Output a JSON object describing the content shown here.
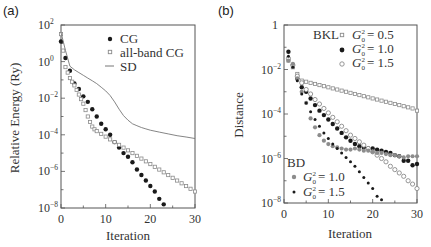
{
  "chart_data": [
    {
      "panel": "(a)",
      "type": "scatter",
      "xlabel": "Iteration",
      "ylabel": "Relative Energy (Ry)",
      "yscale": "log",
      "xlim": [
        0,
        30
      ],
      "ylim": [
        1e-08,
        100
      ],
      "xticks": [
        0,
        10,
        20,
        30
      ],
      "xtick_labels": [
        "0",
        "10",
        "20",
        "30"
      ],
      "yticks_log10": [
        2,
        0,
        -2,
        -4,
        -6,
        -8
      ],
      "ytick_labels": [
        [
          "10",
          "2"
        ],
        [
          "10",
          "0"
        ],
        [
          "10",
          "−2"
        ],
        [
          "10",
          "−4"
        ],
        [
          "10",
          "−6"
        ],
        [
          "10",
          "−8"
        ]
      ],
      "grid": false,
      "legend_position": "upper right",
      "series": [
        {
          "name": "CG",
          "marker": "filled-circle",
          "x": [
            0,
            1,
            2,
            3,
            4,
            5,
            6,
            7,
            8,
            9,
            10,
            11,
            12,
            13,
            14,
            15,
            16,
            17,
            18,
            19,
            20,
            21,
            22,
            23
          ],
          "log10_y": [
            1.1,
            0.2,
            -0.5,
            -1.2,
            -1.5,
            -1.9,
            -2.2,
            -2.6,
            -3.0,
            -3.4,
            -3.7,
            -4.0,
            -4.4,
            -4.7,
            -5.0,
            -5.2,
            -5.5,
            -5.9,
            -6.2,
            -6.5,
            -6.8,
            -7.1,
            -7.5,
            -7.8
          ]
        },
        {
          "name": "all-band CG",
          "marker": "open-square",
          "x": [
            0,
            0.5,
            1,
            1.5,
            2,
            2.5,
            3,
            3.5,
            4,
            4.5,
            5,
            5.5,
            6,
            6.5,
            7,
            7.5,
            8,
            9,
            10,
            11,
            12,
            13,
            14,
            15,
            16,
            17,
            18,
            19,
            20,
            21,
            22,
            23,
            24,
            25,
            26,
            27,
            28,
            29,
            30
          ],
          "log10_y": [
            1.5,
            0.6,
            -0.3,
            -0.6,
            -0.9,
            -1.1,
            -1.3,
            -1.55,
            -1.8,
            -2.05,
            -2.3,
            -2.65,
            -3.0,
            -3.3,
            -3.55,
            -3.7,
            -3.8,
            -3.95,
            -4.1,
            -4.25,
            -4.4,
            -4.55,
            -4.7,
            -4.85,
            -5.0,
            -5.15,
            -5.3,
            -5.45,
            -5.6,
            -5.75,
            -5.9,
            -6.05,
            -6.2,
            -6.35,
            -6.5,
            -6.65,
            -6.8,
            -6.95,
            -7.1
          ]
        },
        {
          "name": "SD",
          "marker": "line",
          "x": [
            0,
            1,
            2,
            3,
            4,
            5,
            6,
            7,
            8,
            9,
            10,
            11,
            12,
            13,
            14,
            15,
            16,
            17,
            18,
            19,
            20,
            22,
            24,
            26,
            28,
            30
          ],
          "log10_y": [
            1.6,
            0.6,
            -0.25,
            -0.45,
            -0.6,
            -0.75,
            -0.9,
            -1.05,
            -1.2,
            -1.4,
            -1.6,
            -1.85,
            -2.2,
            -2.6,
            -2.95,
            -3.2,
            -3.4,
            -3.5,
            -3.6,
            -3.68,
            -3.75,
            -3.85,
            -3.95,
            -4.05,
            -4.12,
            -4.2
          ]
        }
      ]
    },
    {
      "panel": "(b)",
      "type": "scatter",
      "xlabel": "Iteration",
      "ylabel": "Distance",
      "yscale": "log",
      "xlim": [
        0,
        30
      ],
      "ylim": [
        1e-08,
        1
      ],
      "xticks": [
        0,
        10,
        20,
        30
      ],
      "xtick_labels": [
        "0",
        "10",
        "20",
        "30"
      ],
      "yticks_log10": [
        0,
        -2,
        -4,
        -6,
        -8
      ],
      "ytick_labels": [
        [
          "1",
          ""
        ],
        [
          "10",
          "−2"
        ],
        [
          "10",
          "−4"
        ],
        [
          "10",
          "−6"
        ],
        [
          "10",
          "−8"
        ]
      ],
      "grid": false,
      "legend_groups": [
        {
          "title": "BKL",
          "position": "upper right",
          "entries": [
            "G0²=0.5",
            "G0²=1.0",
            "G0²=1.5"
          ]
        },
        {
          "title": "BD",
          "position": "lower left",
          "entries": [
            "G0²=1.0",
            "G0²=1.5"
          ]
        }
      ],
      "series": [
        {
          "name": "BKL G0²=0.5",
          "group": "BKL",
          "marker": "open-square",
          "x": [
            1,
            2,
            3,
            4,
            5,
            6,
            7,
            8,
            9,
            10,
            11,
            12,
            13,
            14,
            15,
            16,
            17,
            18,
            19,
            20,
            21,
            22,
            23,
            24,
            25,
            26,
            27,
            28,
            29,
            30
          ],
          "log10_y": [
            -1.6,
            -1.9,
            -2.2,
            -2.5,
            -2.55,
            -2.6,
            -2.65,
            -2.7,
            -2.75,
            -2.8,
            -2.85,
            -2.9,
            -2.95,
            -3.0,
            -3.05,
            -3.1,
            -3.15,
            -3.2,
            -3.25,
            -3.3,
            -3.35,
            -3.4,
            -3.45,
            -3.5,
            -3.55,
            -3.6,
            -3.65,
            -3.7,
            -3.75,
            -3.85
          ]
        },
        {
          "name": "BKL G0²=1.0",
          "group": "BKL",
          "marker": "filled-circle",
          "x": [
            1,
            2,
            3,
            4,
            5,
            6,
            7,
            8,
            9,
            10,
            11,
            12,
            13,
            14,
            15,
            16,
            17,
            18,
            19,
            20,
            21,
            22,
            23,
            24,
            25,
            26,
            27,
            28,
            29,
            30
          ],
          "log10_y": [
            -1.2,
            -1.8,
            -2.4,
            -2.8,
            -3.0,
            -3.3,
            -3.6,
            -3.85,
            -4.05,
            -4.25,
            -4.45,
            -4.65,
            -4.85,
            -5.05,
            -5.2,
            -5.35,
            -5.45,
            -5.5,
            -5.55,
            -5.55,
            -5.6,
            -5.65,
            -5.7,
            -5.75,
            -5.85,
            -5.9,
            -6.1,
            -6.1,
            -6.3,
            -6.25
          ]
        },
        {
          "name": "BKL G0²=1.5",
          "group": "BKL",
          "marker": "open-circle",
          "x": [
            1,
            2,
            3,
            4,
            5,
            6,
            7,
            8,
            9,
            10,
            11,
            12,
            13,
            14,
            15,
            16,
            17,
            18,
            19,
            20,
            21,
            22,
            23,
            24,
            25,
            26,
            27,
            28,
            29,
            30
          ],
          "log10_y": [
            -1.5,
            -1.8,
            -2.3,
            -2.6,
            -2.9,
            -3.1,
            -3.35,
            -3.55,
            -3.75,
            -3.95,
            -4.15,
            -4.35,
            -4.55,
            -4.75,
            -4.95,
            -5.1,
            -5.25,
            -5.4,
            -5.55,
            -5.7,
            -5.85,
            -6.0,
            -6.15,
            -6.35,
            -6.5,
            -6.65,
            -6.8,
            -7.0,
            -7.15,
            -7.35
          ]
        },
        {
          "name": "BD G0²=1.0",
          "group": "BD",
          "marker": "gray-filled-circle",
          "x": [
            1,
            2,
            3,
            4,
            5,
            6,
            7,
            8,
            9,
            10,
            11,
            12,
            13,
            14,
            15,
            16,
            17,
            18,
            19,
            20,
            21,
            22,
            23,
            24,
            25,
            26,
            27,
            28,
            29,
            30
          ],
          "log10_y": [
            -1.6,
            -1.75,
            -2.4,
            -3.0,
            -3.5,
            -4.2,
            -4.6,
            -4.95,
            -5.2,
            -5.35,
            -5.45,
            -5.5,
            -5.55,
            -5.6,
            -5.6,
            -5.55,
            -5.6,
            -5.65,
            -5.65,
            -5.7,
            -5.75,
            -5.75,
            -5.8,
            -5.85,
            -5.85,
            -5.9,
            -5.95,
            -5.9,
            -5.9,
            -5.9
          ]
        },
        {
          "name": "BD G0²=1.5",
          "group": "BD",
          "marker": "small-filled-circle",
          "x": [
            1,
            2,
            3,
            4,
            5,
            6,
            7,
            8,
            9,
            10,
            11,
            12,
            13,
            14,
            15,
            16,
            17,
            18,
            19,
            20,
            21,
            22
          ],
          "log10_y": [
            -1.4,
            -1.9,
            -2.5,
            -3.1,
            -3.5,
            -3.9,
            -4.25,
            -4.55,
            -4.85,
            -5.1,
            -5.35,
            -5.55,
            -5.75,
            -5.95,
            -6.15,
            -6.35,
            -6.6,
            -6.85,
            -7.1,
            -7.35,
            -7.7,
            -7.85
          ]
        }
      ]
    }
  ],
  "panels": {
    "a": {
      "label": "(a)",
      "xlabel": "Iteration",
      "ylabel": "Relative Energy  (Ry)",
      "legend": [
        {
          "label": "CG"
        },
        {
          "label": "all-band CG"
        },
        {
          "label": "SD"
        }
      ]
    },
    "b": {
      "label": "(b)",
      "xlabel": "Iteration",
      "ylabel": "Distance",
      "legend_bkl_title": "BKL",
      "legend_bd_title": "BD",
      "legend_bkl": [
        {
          "g": "G",
          "sub": "0",
          "sup": "2",
          "value": "= 0.5"
        },
        {
          "g": "G",
          "sub": "0",
          "sup": "2",
          "value": "= 1.0"
        },
        {
          "g": "G",
          "sub": "0",
          "sup": "2",
          "value": "= 1.5"
        }
      ],
      "legend_bd": [
        {
          "g": "G",
          "sub": "0",
          "sup": "2",
          "value": "= 1.0"
        },
        {
          "g": "G",
          "sub": "0",
          "sup": "2",
          "value": "= 1.5"
        }
      ]
    }
  },
  "colors": {
    "axis": "#555555",
    "text": "#333333",
    "filled_marker": "#1a1a1a",
    "open_marker_stroke": "#8a8a8a",
    "gray_marker": "#8c8c8c",
    "sd_line": "#777777"
  }
}
